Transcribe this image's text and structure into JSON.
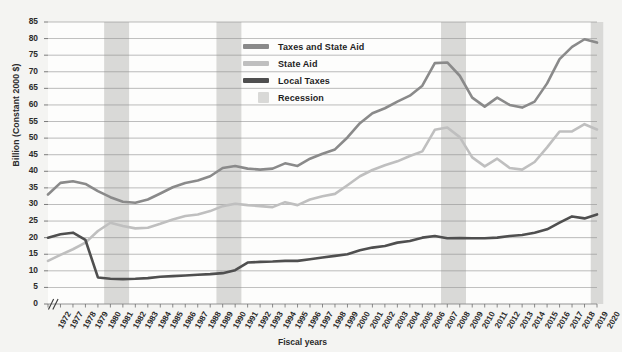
{
  "chart_data": {
    "type": "line",
    "title": "",
    "xlabel": "Fiscal years",
    "ylabel": "Billion (Constant 2000 $)",
    "ylim": [
      0,
      85
    ],
    "ytick_step": 5,
    "grid": true,
    "axis_break_after_first_tick": true,
    "legend_position": "top-center",
    "categories": [
      "1972",
      "1977",
      "1978",
      "1979",
      "1980",
      "1981",
      "1982",
      "1983",
      "1984",
      "1985",
      "1986",
      "1987",
      "1988",
      "1989",
      "1990",
      "1991",
      "1992",
      "1993",
      "1994",
      "1995",
      "1996",
      "1997",
      "1998",
      "1999",
      "2000",
      "2001",
      "2002",
      "2003",
      "2004",
      "2005",
      "2006",
      "2007",
      "2008",
      "2009",
      "2010",
      "2011",
      "2012",
      "2013",
      "2014",
      "2015",
      "2016",
      "2017",
      "2018",
      "2019",
      "2020"
    ],
    "yticks": [
      "0",
      "5",
      "10",
      "15",
      "20",
      "25",
      "30",
      "35",
      "40",
      "45",
      "50",
      "55",
      "60",
      "65",
      "70",
      "75",
      "80",
      "85"
    ],
    "series": [
      {
        "name": "Taxes and State Aid",
        "color": "#8a8a8a",
        "values": [
          33.0,
          36.5,
          37.0,
          36.2,
          34.0,
          32.2,
          30.8,
          30.5,
          31.5,
          33.3,
          35.2,
          36.5,
          37.2,
          38.5,
          41.0,
          41.6,
          40.8,
          40.5,
          40.8,
          42.4,
          41.6,
          43.8,
          45.3,
          46.6,
          50.2,
          54.5,
          57.5,
          59.0,
          61.0,
          62.8,
          65.8,
          72.6,
          72.8,
          68.8,
          62.2,
          59.5,
          62.2,
          60.0,
          59.2,
          61.0,
          66.5,
          73.8,
          77.5,
          79.8,
          78.8
        ]
      },
      {
        "name": "State Aid",
        "color": "#bfbfbf",
        "values": [
          13.0,
          14.8,
          16.5,
          18.5,
          22.0,
          24.5,
          23.5,
          22.8,
          23.0,
          24.2,
          25.5,
          26.5,
          27.0,
          28.0,
          29.5,
          30.2,
          29.8,
          29.5,
          29.2,
          30.7,
          29.8,
          31.5,
          32.5,
          33.2,
          35.8,
          38.5,
          40.4,
          41.8,
          43.0,
          44.6,
          46.0,
          52.5,
          53.2,
          50.3,
          44.2,
          41.5,
          43.8,
          41.0,
          40.5,
          42.8,
          47.2,
          52.0,
          52.0,
          54.2,
          52.6
        ]
      },
      {
        "name": "Local Taxes",
        "color": "#4f4f4f",
        "values": [
          20.0,
          21.0,
          21.5,
          19.3,
          8.0,
          7.6,
          7.5,
          7.6,
          7.8,
          8.2,
          8.4,
          8.6,
          8.8,
          9.0,
          9.3,
          10.2,
          12.5,
          12.7,
          12.8,
          13.0,
          13.0,
          13.5,
          14.0,
          14.5,
          15.0,
          16.2,
          17.0,
          17.5,
          18.5,
          19.0,
          20.0,
          20.5,
          19.8,
          19.9,
          19.8,
          19.8,
          20.0,
          20.5,
          20.8,
          21.5,
          22.5,
          24.5,
          26.4,
          25.8,
          27.0
        ]
      }
    ],
    "recessions": [
      {
        "label": "Recession",
        "start": "1981",
        "end": "1982"
      },
      {
        "label": "Recession",
        "start": "1990",
        "end": "1991"
      },
      {
        "label": "Recession",
        "start": "2008",
        "end": "2009"
      },
      {
        "label": "Recession",
        "start": "2020",
        "end": "2020"
      }
    ],
    "recession_color": "#d9d9d7",
    "grid_color": "#8f8f8f",
    "background": "#f4f4f2",
    "plot_background": "#fdfdfc"
  },
  "legend": {
    "items": [
      {
        "label": "Taxes and State Aid",
        "color": "#8a8a8a",
        "kind": "line"
      },
      {
        "label": "State Aid",
        "color": "#bfbfbf",
        "kind": "line"
      },
      {
        "label": "Local Taxes",
        "color": "#4f4f4f",
        "kind": "line"
      },
      {
        "label": "Recession",
        "color": "#d9d9d7",
        "kind": "box"
      }
    ]
  }
}
